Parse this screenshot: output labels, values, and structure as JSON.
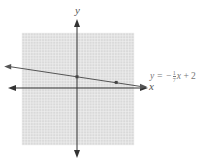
{
  "chart_data": {
    "type": "line",
    "title": "",
    "xlabel": "x",
    "ylabel": "y",
    "grid": true,
    "xlim": [
      -10,
      10
    ],
    "ylim": [
      -10,
      10
    ],
    "series": [
      {
        "name": "y = -1/7 x + 2",
        "equation": "y = -¹⁄₇x + 2",
        "slope": -0.142857,
        "intercept": 2,
        "points": [
          {
            "x": 0,
            "y": 2
          },
          {
            "x": 7,
            "y": 1
          }
        ]
      }
    ],
    "annotations": [
      {
        "text": "y = -1/7 x + 2",
        "position": "right of line end"
      }
    ]
  },
  "labels": {
    "x_axis": "x",
    "y_axis": "y",
    "equation_lhs": "y = −",
    "equation_num": "1",
    "equation_den": "7",
    "equation_var": "x",
    "equation_rhs": " + 2"
  },
  "colors": {
    "grid_bg": "#d9d9d9",
    "grid_line": "#f2f2f2",
    "axis": "#333333",
    "line": "#555555"
  }
}
